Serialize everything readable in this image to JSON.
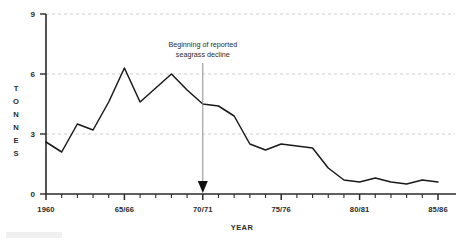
{
  "chart_data": {
    "type": "line",
    "title": "",
    "xlabel": "YEAR",
    "ylabel": "TONNES",
    "ylim": [
      0,
      9
    ],
    "yticks": [
      0,
      3,
      6,
      9
    ],
    "ytick_labels": [
      "0",
      "3",
      "6",
      "9"
    ],
    "grid": "horizontal dashed gridlines at 3, 6 and 9",
    "legend": "none",
    "xlim": [
      1960,
      1985
    ],
    "xtick_labels": [
      "1960",
      "65/66",
      "70/71",
      "75/76",
      "80/81",
      "85/86"
    ],
    "xtick_positions": [
      1960,
      1965,
      1970,
      1975,
      1980,
      1985
    ],
    "x": [
      1960,
      1961,
      1962,
      1963,
      1964,
      1965,
      1966,
      1967,
      1968,
      1969,
      1970,
      1971,
      1972,
      1973,
      1974,
      1975,
      1976,
      1977,
      1978,
      1979,
      1980,
      1981,
      1982,
      1983,
      1984,
      1985
    ],
    "x_labels": [
      "1960",
      "1961",
      "1962",
      "1963",
      "1964",
      "65/66",
      "1966",
      "1967",
      "1968",
      "1969",
      "70/71",
      "1971",
      "1972",
      "1973",
      "1974",
      "75/76",
      "1976",
      "1977",
      "1978",
      "1979",
      "80/81",
      "1981",
      "1982",
      "1983",
      "1984",
      "85/86"
    ],
    "values": [
      2.6,
      2.1,
      3.5,
      3.2,
      4.6,
      6.3,
      4.6,
      5.3,
      6.0,
      5.2,
      4.5,
      4.4,
      3.9,
      2.5,
      2.2,
      2.5,
      2.4,
      2.3,
      1.3,
      0.7,
      0.6,
      0.8,
      0.6,
      0.5,
      0.7,
      0.6
    ],
    "annotations": [
      {
        "text_line1": "Beginning of reported",
        "text_line2": "seagrass decline",
        "points_to_x": "70/71",
        "points_to_y": 0,
        "style": "vertical gray line with black downward arrowhead"
      }
    ],
    "colors": {
      "line": "#1a1a1a",
      "grid": "#cfcfcf",
      "axis": "#2b2b2b",
      "annotation_line": "#8c8c8c",
      "arrowhead": "#111111",
      "background": "#ffffff"
    }
  },
  "axes": {
    "y_title_letters": [
      "T",
      "O",
      "N",
      "N",
      "E",
      "S"
    ],
    "x_title": "YEAR"
  }
}
